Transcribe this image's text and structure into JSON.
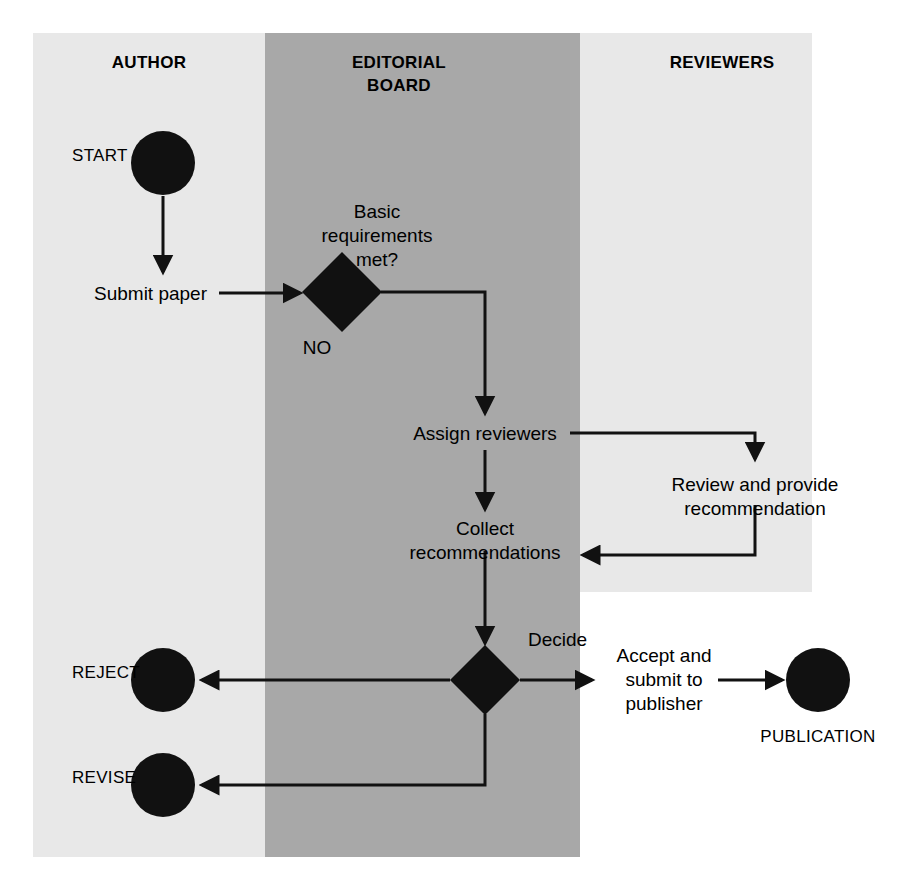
{
  "diagram": {
    "type": "swimlane-flowchart",
    "canvas": {
      "width": 899,
      "height": 887,
      "background": "#ffffff"
    },
    "lanes": [
      {
        "id": "author",
        "label": "AUTHOR",
        "color": "#e8e8e8",
        "x": 33,
        "y": 33,
        "width": 232,
        "height": 824,
        "title_x": 149,
        "title_y": 68
      },
      {
        "id": "editorial-board",
        "label_line1": "EDITORIAL",
        "label_line2": "BOARD",
        "color": "#a8a8a8",
        "x": 265,
        "y": 33,
        "width": 315,
        "height": 824,
        "title_x": 399,
        "title_y": 68,
        "title_y2": 91
      },
      {
        "id": "reviewers",
        "label": "REVIEWERS",
        "color": "#e8e8e8",
        "x": 580,
        "y": 33,
        "width": 232,
        "height": 559,
        "title_x": 722,
        "title_y": 68
      }
    ],
    "nodes": [
      {
        "id": "start",
        "kind": "terminator",
        "label": "START",
        "cx": 163,
        "cy": 163,
        "r": 32,
        "label_x": 72,
        "label_y": 161,
        "label_anchor": "start"
      },
      {
        "id": "submit-paper",
        "kind": "activity",
        "label": "Submit paper",
        "label_x": 94,
        "label_y": 300,
        "label_anchor": "start"
      },
      {
        "id": "basic-requirements",
        "kind": "decision",
        "label_line1": "Basic",
        "label_line2": "requirements",
        "label_line3": "met?",
        "cx": 342,
        "cy": 292,
        "rx": 40,
        "ry": 40,
        "label_x": 377,
        "label_y": 218,
        "label_anchor": "middle",
        "branch_no": "NO",
        "branch_no_x": 317,
        "branch_no_y": 354
      },
      {
        "id": "assign-reviewers",
        "kind": "activity",
        "label": "Assign reviewers",
        "label_x": 485,
        "label_y": 440,
        "label_anchor": "middle"
      },
      {
        "id": "review-and-provide",
        "kind": "activity",
        "label_line1": "Review and provide",
        "label_line2": "recommendation",
        "label_x": 755,
        "label_y": 491,
        "label_anchor": "middle"
      },
      {
        "id": "collect-recommendations",
        "kind": "activity",
        "label_line1": "Collect",
        "label_line2": "recommendations",
        "label_x": 485,
        "label_y": 535,
        "label_anchor": "middle"
      },
      {
        "id": "decide",
        "kind": "decision",
        "label": "Decide",
        "cx": 485,
        "cy": 680,
        "rx": 35,
        "ry": 35,
        "label_x": 528,
        "label_y": 646,
        "label_anchor": "start"
      },
      {
        "id": "accept-and-submit",
        "kind": "activity",
        "label_line1": "Accept and",
        "label_line2": "submit to",
        "label_line3": "publisher",
        "label_x": 664,
        "label_y": 662,
        "label_anchor": "middle"
      },
      {
        "id": "publication",
        "kind": "terminator",
        "label": "PUBLICATION",
        "cx": 818,
        "cy": 680,
        "r": 32,
        "label_x": 818,
        "label_y": 742,
        "label_anchor": "middle"
      },
      {
        "id": "reject",
        "kind": "terminator",
        "label": "REJECT",
        "cx": 163,
        "cy": 680,
        "r": 32,
        "label_x": 72,
        "label_y": 678,
        "label_anchor": "start"
      },
      {
        "id": "revise",
        "kind": "terminator",
        "label": "REVISE",
        "cx": 163,
        "cy": 785,
        "r": 32,
        "label_x": 72,
        "label_y": 783,
        "label_anchor": "start"
      }
    ],
    "connectors": [
      {
        "id": "start-to-submit",
        "path": "M 163 196 L 163 272",
        "arrow_end": true
      },
      {
        "id": "submit-to-requirements",
        "path": "M 219 293 L 300 293",
        "arrow_end": true
      },
      {
        "id": "requirements-to-assign",
        "path": "M 381 292 L 485 292 L 485 413",
        "arrow_end": true
      },
      {
        "id": "assign-to-review",
        "path": "M 570 433 L 755 433 L 755 459",
        "arrow_end": true
      },
      {
        "id": "assign-to-collect",
        "path": "M 485 450 L 485 509",
        "arrow_end": true
      },
      {
        "id": "review-to-collect",
        "path": "M 755 505 L 755 555 L 583 555",
        "arrow_end": true
      },
      {
        "id": "collect-to-decide",
        "path": "M 485 551 L 485 643",
        "arrow_end": true
      },
      {
        "id": "decide-to-reject",
        "path": "M 450 680 L 202 680",
        "arrow_end": true
      },
      {
        "id": "decide-to-accept",
        "path": "M 520 680 L 592 680",
        "arrow_end": true
      },
      {
        "id": "accept-to-publication",
        "path": "M 718 680 L 782 680",
        "arrow_end": true
      },
      {
        "id": "decide-to-revise",
        "path": "M 485 714 L 485 785 L 202 785",
        "arrow_end": true
      }
    ],
    "colors": {
      "lane_light": "#e8e8e8",
      "lane_dark": "#a8a8a8",
      "shape": "#111111",
      "line": "#111111",
      "text": "#000000",
      "background": "#ffffff"
    }
  }
}
